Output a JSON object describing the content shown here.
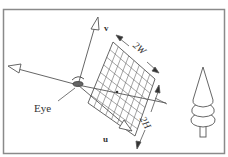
{
  "figure": {
    "type": "camera-view-plane-diagram",
    "labels": {
      "eye": "Eye",
      "v_axis": "v",
      "u_axis": "u",
      "width": "2W",
      "height": "2H"
    },
    "icons": {
      "eye": "eye-icon",
      "tree": "tree-icon"
    },
    "colors": {
      "stroke": "#555555",
      "frame": "#8a8a8a",
      "background": "#ffffff"
    },
    "grid": {
      "rows": 8,
      "cols": 8
    }
  }
}
